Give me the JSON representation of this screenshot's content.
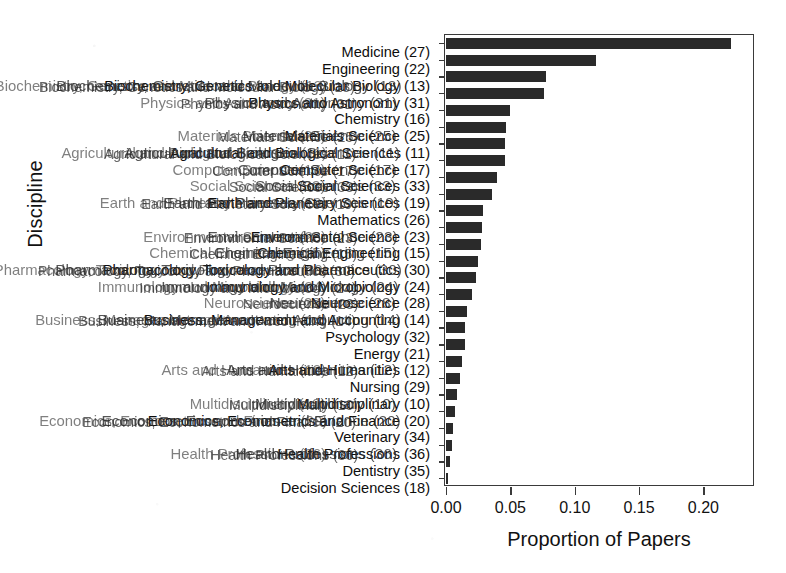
{
  "chart_data": {
    "type": "bar",
    "orientation": "horizontal",
    "title": "",
    "xlabel": "Proportion of Papers",
    "ylabel": "Discipline",
    "xlim": [
      0.0,
      0.2385
    ],
    "grid": false,
    "legend": null,
    "xticks": [
      "0.00",
      "0.05",
      "0.10",
      "0.15",
      "0.20"
    ],
    "xtick_values": [
      0.0,
      0.05,
      0.1,
      0.15,
      0.2
    ],
    "categories": [
      "Medicine (27)",
      "Engineering (22)",
      "Biochemistry, Genetics and Molecular Biology (13)",
      "Physics and Astronomy (31)",
      "Chemistry (16)",
      "Materials Science (25)",
      "Agricultural and Biological Sciences (11)",
      "Computer Science (17)",
      "Social Sciences (33)",
      "Earth and Planetary Sciences (19)",
      "Mathematics (26)",
      "Environmental Science (23)",
      "Chemical Engineering (15)",
      "Pharmacology, Toxicology and Pharmaceutics (30)",
      "Immunology and Microbiology (24)",
      "Neuroscience (28)",
      "Business, Management and Accounting (14)",
      "Psychology (32)",
      "Energy (21)",
      "Arts and Humanities (12)",
      "Nursing (29)",
      "Multidisciplinary (10)",
      "Economics, Econometrics and Finance (20)",
      "Veterinary (34)",
      "Health Professions (36)",
      "Dentistry (35)",
      "Decision Sciences (18)"
    ],
    "values": [
      0.2215,
      0.1165,
      0.0775,
      0.0765,
      0.05,
      0.0465,
      0.046,
      0.0455,
      0.0395,
      0.0355,
      0.029,
      0.028,
      0.0275,
      0.025,
      0.023,
      0.02,
      0.016,
      0.015,
      0.0145,
      0.0125,
      0.011,
      0.0085,
      0.007,
      0.0055,
      0.0045,
      0.003,
      0.0015
    ],
    "bar_color": "#2a2a2a",
    "axis_color": "#3a3a3a"
  }
}
